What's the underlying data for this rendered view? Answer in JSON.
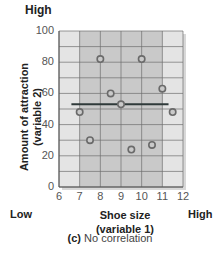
{
  "chart_data": {
    "type": "scatter",
    "title": "",
    "caption_prefix": "(c)",
    "caption_text": " No correlation",
    "xlabel_line1": "Shoe size",
    "xlabel_line2": "(variable 1)",
    "ylabel_line1": "Amount of attraction",
    "ylabel_line2": "(variable 2)",
    "x_low_label": "Low",
    "x_high_label": "High",
    "y_high_label": "High",
    "xlim": [
      6,
      12
    ],
    "ylim": [
      0,
      100
    ],
    "x_ticks": [
      6,
      7,
      8,
      9,
      10,
      11,
      12
    ],
    "y_ticks": [
      0,
      20,
      40,
      60,
      80,
      100
    ],
    "grid": true,
    "highlight_band_x": [
      7,
      11
    ],
    "points": [
      {
        "x": 7,
        "y": 48
      },
      {
        "x": 7.5,
        "y": 30
      },
      {
        "x": 8,
        "y": 82
      },
      {
        "x": 8.5,
        "y": 60
      },
      {
        "x": 9,
        "y": 53
      },
      {
        "x": 9.5,
        "y": 24
      },
      {
        "x": 10,
        "y": 82
      },
      {
        "x": 10.5,
        "y": 27
      },
      {
        "x": 11,
        "y": 63
      },
      {
        "x": 11.5,
        "y": 48
      }
    ],
    "trend_line": {
      "x_start": 6.6,
      "x_end": 11.3,
      "y": 53
    },
    "colors": {
      "plot_bg": "#e4e4e4",
      "band_bg": "#c9c9c9",
      "grid": "#6e6e6e",
      "point_stroke": "#6a6a6a",
      "trend": "#2f3a3a"
    }
  }
}
